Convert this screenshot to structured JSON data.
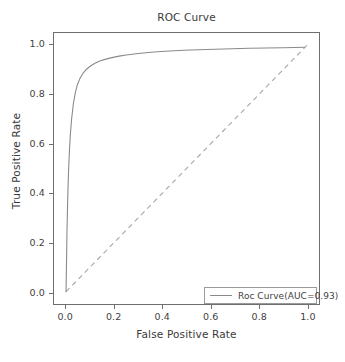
{
  "chart_data": {
    "type": "line",
    "title": "ROC Curve",
    "xlabel": "False Positive Rate",
    "ylabel": "True Positive Rate",
    "xlim": [
      -0.05,
      1.05
    ],
    "ylim": [
      -0.05,
      1.05
    ],
    "grid": false,
    "legend_position": "lower right",
    "xticks": [
      "0.0",
      "0.2",
      "0.4",
      "0.6",
      "0.8",
      "1.0"
    ],
    "xtick_values": [
      0.0,
      0.2,
      0.4,
      0.6,
      0.8,
      1.0
    ],
    "yticks": [
      "0.0",
      "0.2",
      "0.4",
      "0.6",
      "0.8",
      "1.0"
    ],
    "ytick_values": [
      0.0,
      0.2,
      0.4,
      0.6,
      0.8,
      1.0
    ],
    "auc": 0.93,
    "series": [
      {
        "name": "Roc Curve(AUC=0.93)",
        "style": "solid",
        "color": "#8a8a8a",
        "x": [
          0.0,
          0.002,
          0.004,
          0.007,
          0.01,
          0.014,
          0.018,
          0.023,
          0.03,
          0.038,
          0.047,
          0.058,
          0.07,
          0.085,
          0.1,
          0.12,
          0.14,
          0.165,
          0.19,
          0.22,
          0.25,
          0.29,
          0.33,
          0.38,
          0.43,
          0.49,
          0.55,
          0.62,
          0.69,
          0.76,
          0.83,
          0.9,
          0.95,
          0.99
        ],
        "y": [
          0.0,
          0.12,
          0.25,
          0.38,
          0.48,
          0.57,
          0.64,
          0.7,
          0.76,
          0.805,
          0.84,
          0.866,
          0.886,
          0.903,
          0.915,
          0.927,
          0.936,
          0.944,
          0.95,
          0.956,
          0.961,
          0.966,
          0.97,
          0.974,
          0.977,
          0.98,
          0.982,
          0.984,
          0.986,
          0.988,
          0.989,
          0.99,
          0.991,
          0.992
        ]
      },
      {
        "name": "chance-diagonal",
        "style": "dashed",
        "color": "#a6a6a6",
        "x": [
          0.0,
          1.0
        ],
        "y": [
          0.0,
          1.0
        ]
      }
    ]
  },
  "legend": {
    "entries": [
      {
        "label": "Roc Curve(AUC=0.93)"
      }
    ]
  }
}
